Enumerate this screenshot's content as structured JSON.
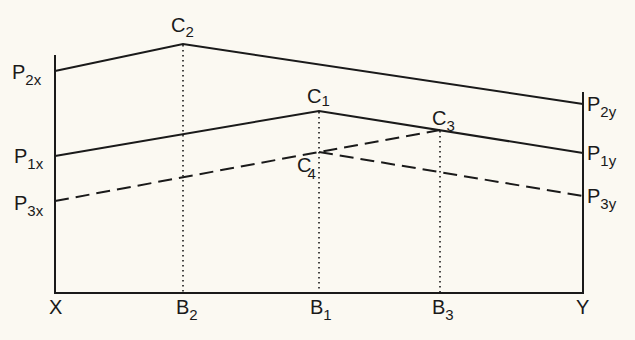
{
  "diagram": {
    "type": "line-diagram",
    "axis_labels": {
      "left": "X",
      "right": "Y"
    },
    "bottom_labels": [
      {
        "main": "X",
        "sub": "",
        "x": 55
      },
      {
        "main": "B",
        "sub": "2",
        "x": 183
      },
      {
        "main": "B",
        "sub": "1",
        "x": 319
      },
      {
        "main": "B",
        "sub": "3",
        "x": 440
      },
      {
        "main": "Y",
        "sub": "",
        "x": 583
      }
    ],
    "left_labels": [
      {
        "main": "P",
        "sub": "2x",
        "y": 71
      },
      {
        "main": "P",
        "sub": "1x",
        "y": 156
      },
      {
        "main": "P",
        "sub": "3x",
        "y": 201
      }
    ],
    "right_labels": [
      {
        "main": "P",
        "sub": "2y",
        "y": 104
      },
      {
        "main": "P",
        "sub": "1y",
        "y": 153
      },
      {
        "main": "P",
        "sub": "3y",
        "y": 196
      }
    ],
    "peak_labels": [
      {
        "main": "C",
        "sub": "2"
      },
      {
        "main": "C",
        "sub": "1"
      },
      {
        "main": "C",
        "sub": "3"
      },
      {
        "main": "C",
        "sub": "4"
      }
    ],
    "lines": [
      {
        "name": "P2",
        "style": "solid",
        "points": [
          [
            55,
            71
          ],
          [
            183,
            44
          ],
          [
            583,
            104
          ]
        ]
      },
      {
        "name": "P1",
        "style": "solid",
        "points": [
          [
            55,
            156
          ],
          [
            319,
            111
          ],
          [
            583,
            153
          ]
        ]
      },
      {
        "name": "P3",
        "style": "dashed",
        "points": [
          [
            55,
            201
          ],
          [
            319,
            152
          ],
          [
            440,
            130
          ],
          [
            583,
            196
          ]
        ]
      }
    ],
    "colors": {
      "ink": "#1a1a1a",
      "paper": "#fbf9f2"
    }
  }
}
